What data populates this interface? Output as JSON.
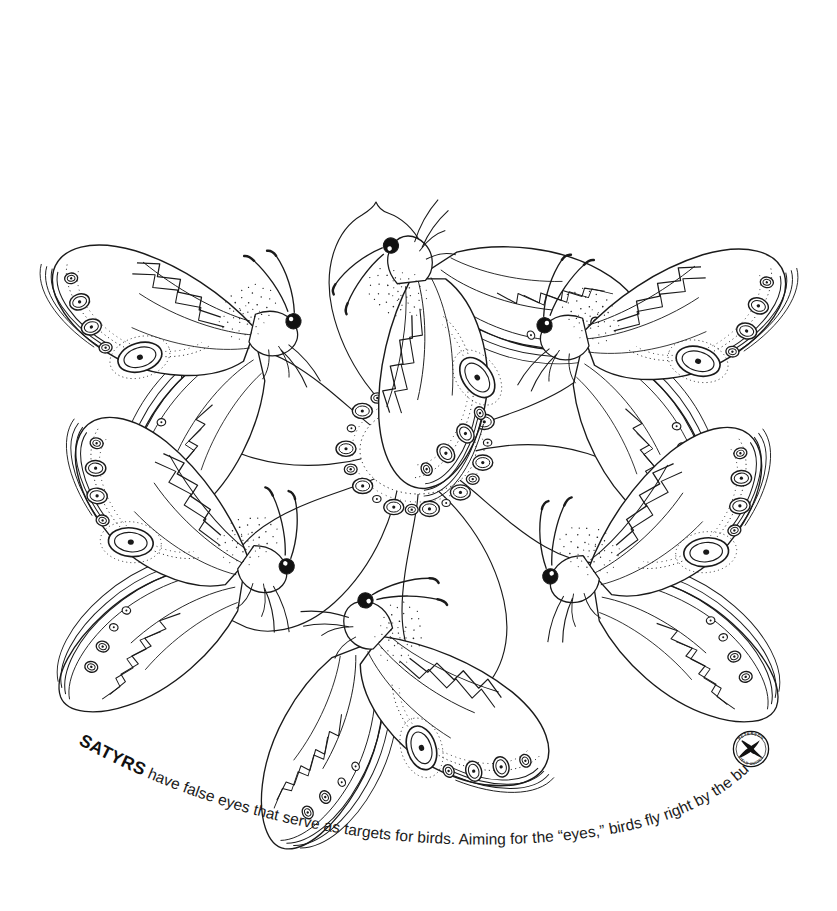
{
  "page": {
    "width": 837,
    "height": 911,
    "background_color": "#ffffff",
    "ink_color": "#1a1a1a"
  },
  "caption": {
    "lead_word": "SATYRS",
    "body_text": " have false eyes that serve as targets for birds. Aiming for the “eyes,” birds fly right by the butterfly’s body!",
    "full_text": "SATYRS have false eyes that serve as targets for birds. Aiming for the “eyes,” birds fly right by the butterfly’s body!"
  },
  "logo": {
    "name": "peterson-field-guides-badge",
    "top_arc_text": "PETERSON",
    "bottom_arc_text": "FIELD GUIDES",
    "emblem": "bird-silhouette"
  },
  "illustration": {
    "subject": "satyr butterflies on a flower",
    "style": "black line art, coloring book",
    "butterfly_count": 7,
    "petal_count": 6,
    "center_motif": "ring-of-eyespots",
    "center_eyespot_count": 22,
    "butterflies": [
      {
        "id": "butterfly-top",
        "position": "top",
        "cx": 455,
        "cy": 155,
        "rotation": -18,
        "flip": false
      },
      {
        "id": "butterfly-upper-left",
        "position": "upper-left",
        "cx": 160,
        "cy": 285,
        "rotation": -6,
        "flip": false
      },
      {
        "id": "butterfly-upper-right",
        "position": "upper-right",
        "cx": 675,
        "cy": 290,
        "rotation": 6,
        "flip": true
      },
      {
        "id": "butterfly-lower-left",
        "position": "lower-left",
        "cx": 160,
        "cy": 565,
        "rotation": 10,
        "flip": false
      },
      {
        "id": "butterfly-lower-right",
        "position": "lower-right",
        "cx": 675,
        "cy": 570,
        "rotation": -10,
        "flip": true
      },
      {
        "id": "butterfly-bottom",
        "position": "bottom",
        "cx": 450,
        "cy": 715,
        "rotation": 20,
        "flip": true
      },
      {
        "id": "butterfly-center-low",
        "position": "bottom-inner",
        "cx": 450,
        "cy": 715,
        "rotation": 20,
        "flip": true
      }
    ],
    "wing_features": [
      "forewing-eyespot-row",
      "hindwing-eyespot-row",
      "large-central-ocellus",
      "zigzag-median-band",
      "concentric-margin-bands",
      "stippled-thorax-fur",
      "clubbed-antennae",
      "compound-eye"
    ]
  }
}
